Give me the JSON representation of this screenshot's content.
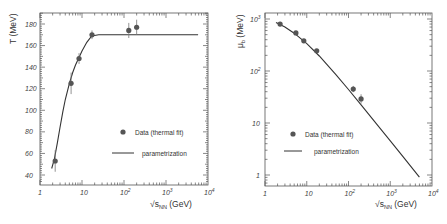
{
  "chart_data": [
    {
      "type": "scatter",
      "title": "",
      "xlabel": "√s_NN (GeV)",
      "ylabel": "T (MeV)",
      "xscale": "log",
      "yscale": "linear",
      "xlim": [
        1,
        10000
      ],
      "ylim": [
        32,
        190
      ],
      "grid": false,
      "x_ticks": [
        {
          "value": 1,
          "label": "1"
        },
        {
          "value": 10,
          "label": "10"
        },
        {
          "value": 100,
          "label": "10",
          "sup": "2"
        },
        {
          "value": 1000,
          "label": "10",
          "sup": "3"
        },
        {
          "value": 10000,
          "label": "10",
          "sup": "4"
        }
      ],
      "y_ticks": [
        40,
        60,
        80,
        100,
        120,
        140,
        160,
        180
      ],
      "legend": {
        "position": "lower right",
        "entries": [
          "Data (thermal fit)",
          "parametrization"
        ]
      },
      "series": [
        {
          "name": "Data (thermal fit)",
          "kind": "points",
          "x": [
            2.3,
            5.5,
            8.5,
            17.3,
            130,
            200
          ],
          "y": [
            53,
            125,
            148,
            170,
            174,
            177
          ],
          "err": [
            10,
            10,
            5,
            4,
            7,
            7
          ]
        },
        {
          "name": "parametrization",
          "kind": "line",
          "x": [
            1.9,
            2.2,
            2.6,
            3.0,
            3.5,
            4.0,
            5.0,
            6.0,
            7.0,
            8.5,
            10,
            13,
            17,
            25,
            40,
            100,
            5800
          ],
          "y": [
            46,
            55,
            70,
            84,
            99,
            110,
            125,
            135,
            142,
            149,
            155,
            163,
            169,
            170,
            170,
            170,
            170
          ]
        }
      ]
    },
    {
      "type": "scatter",
      "title": "",
      "xlabel": "√s_NN (GeV)",
      "ylabel": "μ_b (MeV)",
      "xscale": "log",
      "yscale": "log",
      "xlim": [
        1,
        10000
      ],
      "ylim": [
        0.6,
        1250
      ],
      "grid": false,
      "x_ticks": [
        {
          "value": 1,
          "label": "1"
        },
        {
          "value": 10,
          "label": "10"
        },
        {
          "value": 100,
          "label": "10",
          "sup": "2"
        },
        {
          "value": 1000,
          "label": "10",
          "sup": "3"
        },
        {
          "value": 10000,
          "label": "10",
          "sup": "4"
        }
      ],
      "y_ticks": [
        {
          "value": 1,
          "label": "1"
        },
        {
          "value": 10,
          "label": "10"
        },
        {
          "value": 100,
          "label": "10",
          "sup": "2"
        },
        {
          "value": 1000,
          "label": "10",
          "sup": "3"
        }
      ],
      "legend": {
        "position": "lower left",
        "entries": [
          "Data (thermal fit)",
          "parametrization"
        ]
      },
      "series": [
        {
          "name": "Data (thermal fit)",
          "kind": "points",
          "x": [
            2.3,
            5.5,
            8.5,
            17.3,
            130,
            200
          ],
          "y": [
            800,
            540,
            380,
            245,
            45,
            29
          ],
          "err_log": [
            0.03,
            0.03,
            0.03,
            0.03,
            0.06,
            0.09
          ]
        },
        {
          "name": "parametrization",
          "kind": "line",
          "x": [
            1.83,
            3,
            5,
            10,
            20,
            50,
            100,
            200,
            500,
            1000,
            2000,
            5000
          ],
          "y": [
            855,
            700,
            533,
            337,
            194,
            85.2,
            44.0,
            22.4,
            9.05,
            4.54,
            2.28,
            0.91
          ]
        }
      ]
    }
  ],
  "left_chart": {
    "ylabel": "T (MeV)",
    "xlabel_main": "√s",
    "xlabel_sub": "NN",
    "xlabel_unit": " (GeV)",
    "legend_points": "Data (thermal fit)",
    "legend_line": "parametrization"
  },
  "right_chart": {
    "ylabel_main": "μ",
    "ylabel_sub": "b",
    "ylabel_unit": " (MeV)",
    "xlabel_main": "√s",
    "xlabel_sub": "NN",
    "xlabel_unit": " (GeV)",
    "legend_points": "Data (thermal fit)",
    "legend_line": "parametrization"
  }
}
